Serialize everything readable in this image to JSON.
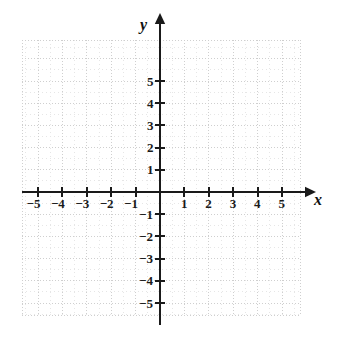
{
  "chart_data": {
    "type": "scatter",
    "title": "",
    "xlabel": "x",
    "ylabel": "y",
    "grid": true,
    "legend": false,
    "series": [],
    "points": [],
    "xlim": [
      -5.6,
      5.7
    ],
    "ylim": [
      -5.7,
      5.9
    ],
    "x_ticks": [
      -5,
      -4,
      -3,
      -2,
      -1,
      1,
      2,
      3,
      4,
      5
    ],
    "y_ticks": [
      5,
      4,
      3,
      2,
      1,
      -1,
      -2,
      -3,
      -4,
      -5
    ],
    "x_tick_labels": [
      "−5",
      "−4",
      "−3",
      "−2",
      "−1",
      "1",
      "2",
      "3",
      "4",
      "5"
    ],
    "y_tick_labels": [
      "5",
      "4",
      "3",
      "2",
      "1",
      "−1",
      "−2",
      "−3",
      "−4",
      "−5"
    ],
    "origin_label": "",
    "x_axis_arrow": true,
    "y_axis_arrow": true
  },
  "figure": {
    "x_axis_name": "x",
    "y_axis_name": "y"
  },
  "colors": {
    "axis": "#1a1a1a",
    "grid_major": "#cfcfcf",
    "grid_minor": "#e6e6e6",
    "label": "#1a1a1a",
    "background": "#ffffff"
  },
  "geometry": {
    "origin_x": 160,
    "origin_y": 192,
    "unit_x": 24.4,
    "unit_y": 22.2,
    "grid_left": 22,
    "grid_right": 300,
    "grid_top": 40,
    "grid_bottom": 315
  }
}
